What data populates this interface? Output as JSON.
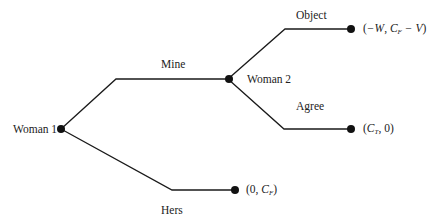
{
  "diagram": {
    "type": "game-tree",
    "players": {
      "root": "Woman 1",
      "second": "Woman 2"
    },
    "actions": {
      "mine": "Mine",
      "hers": "Hers",
      "object": "Object",
      "agree": "Agree"
    },
    "payoffs": {
      "object": {
        "open": "(",
        "a": "−W",
        "sep": ", ",
        "b_main": "C",
        "b_sub": "F",
        "b_rest": " − V",
        "close": ")"
      },
      "agree": {
        "open": "(",
        "a_main": "C",
        "a_sub": "T",
        "sep": ", ",
        "b": "0",
        "close": ")"
      },
      "hers": {
        "open": "(",
        "a": "0",
        "sep": ", ",
        "b_main": "C",
        "b_sub": "F",
        "close": ")"
      }
    },
    "colors": {
      "line": "#1a1a1a",
      "node": "#111111",
      "text": "#222222",
      "background": "#ffffff"
    }
  }
}
